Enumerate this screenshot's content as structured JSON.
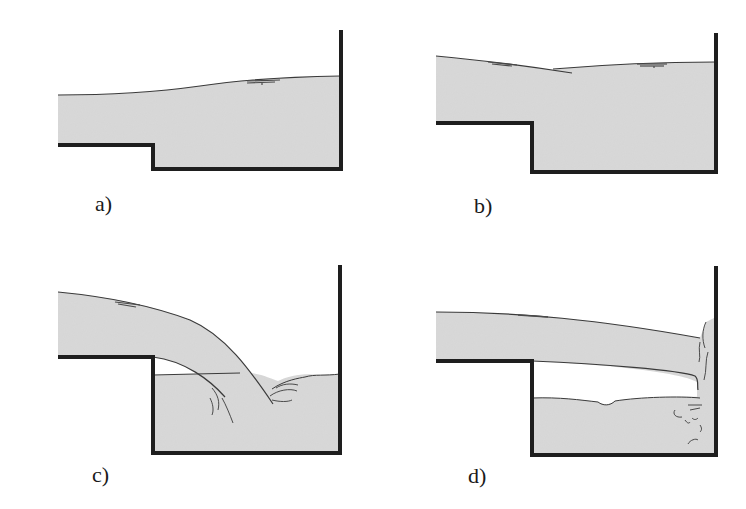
{
  "figure": {
    "colors": {
      "water": "#d9d9d9",
      "structure": "#1e1e1e",
      "surface_line": "#3a3a3a",
      "background": "#ffffff"
    },
    "panels": [
      {
        "id": "a",
        "label": "a)",
        "regime": "submerged flow, water surface rising towards end wall"
      },
      {
        "id": "b",
        "label": "b)",
        "regime": "surface jump with local depression above the step"
      },
      {
        "id": "c",
        "label": "c)",
        "regime": "free-falling nappe plunging into tailwater pool"
      },
      {
        "id": "d",
        "label": "d)",
        "regime": "jet impinging on end wall with air cavity beneath"
      }
    ]
  }
}
